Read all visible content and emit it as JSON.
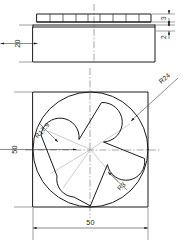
{
  "drawing": {
    "title": "Star plate orthographic drawing",
    "views": {
      "front": {
        "name": "front-elevation-view",
        "dimensions": [
          {
            "id": "height-20",
            "label": "20",
            "orientation": "vertical",
            "side": "left"
          },
          {
            "id": "rib-3",
            "label": "3",
            "orientation": "vertical",
            "side": "right"
          },
          {
            "id": "flange-2",
            "label": "2",
            "orientation": "vertical",
            "side": "right"
          }
        ],
        "features": {
          "rib_count": 9,
          "rib_strip_label": "ribbed top strip",
          "body_label": "main body block"
        }
      },
      "plan": {
        "name": "plan-view",
        "dimensions": [
          {
            "id": "width-50",
            "label": "50",
            "orientation": "horizontal",
            "side": "bottom"
          },
          {
            "id": "height-50",
            "label": "50",
            "orientation": "vertical",
            "side": "left"
          }
        ],
        "radii": [
          {
            "id": "r24",
            "label": "R24",
            "target": "outer-circle"
          },
          {
            "id": "r17-9",
            "label": "R17.9",
            "target": "star-concave-arc"
          },
          {
            "id": "r3",
            "label": "R3",
            "target": "star-point-fillet"
          }
        ],
        "features": {
          "square_label": "square plate outline",
          "circle_label": "inscribed circle",
          "star_label": "five-pointed star cutout",
          "star_points": 5
        }
      }
    },
    "colors": {
      "outline": "#1a1a1a",
      "dimension": "#2b2b2b",
      "centerline": "#4a4a4a",
      "construction": "#8d8d8d",
      "background": "#ffffff"
    }
  }
}
